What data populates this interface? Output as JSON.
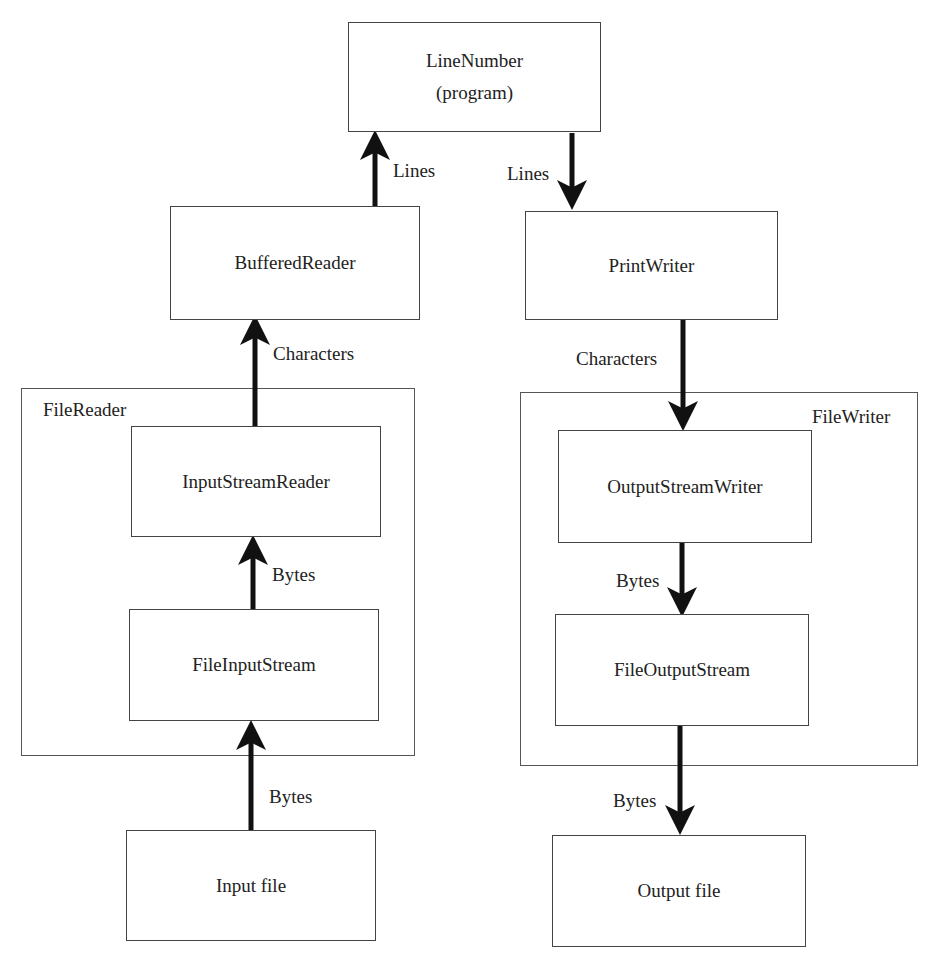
{
  "nodes": {
    "line_number": {
      "title": "LineNumber",
      "subtitle": "(program)"
    },
    "buffered_reader": {
      "label": "BufferedReader"
    },
    "print_writer": {
      "label": "PrintWriter"
    },
    "input_stream_reader": {
      "label": "InputStreamReader"
    },
    "file_input_stream": {
      "label": "FileInputStream"
    },
    "output_stream_writer": {
      "label": "OutputStreamWriter"
    },
    "file_output_stream": {
      "label": "FileOutputStream"
    },
    "input_file": {
      "label": "Input file"
    },
    "output_file": {
      "label": "Output file"
    }
  },
  "groups": {
    "file_reader": {
      "label": "FileReader"
    },
    "file_writer": {
      "label": "FileWriter"
    }
  },
  "edges": [
    {
      "from": "buffered_reader",
      "to": "line_number",
      "label": "Lines"
    },
    {
      "from": "line_number",
      "to": "print_writer",
      "label": "Lines"
    },
    {
      "from": "input_stream_reader",
      "to": "buffered_reader",
      "label": "Characters"
    },
    {
      "from": "print_writer",
      "to": "output_stream_writer",
      "label": "Characters"
    },
    {
      "from": "file_input_stream",
      "to": "input_stream_reader",
      "label": "Bytes"
    },
    {
      "from": "output_stream_writer",
      "to": "file_output_stream",
      "label": "Bytes"
    },
    {
      "from": "input_file",
      "to": "file_input_stream",
      "label": "Bytes"
    },
    {
      "from": "file_output_stream",
      "to": "output_file",
      "label": "Bytes"
    }
  ]
}
